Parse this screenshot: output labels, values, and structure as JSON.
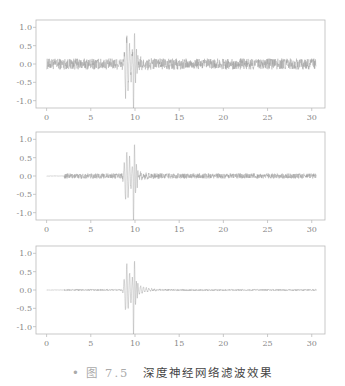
{
  "caption": {
    "bullet": "•",
    "figure_number": "图 7.5",
    "text": "深度神经网络滤波效果"
  },
  "colors": {
    "signal": "#9a9a9a",
    "axes": "#bbbbbb",
    "tick_text": "#888888"
  },
  "chart_data": [
    {
      "type": "line",
      "label": "a)",
      "title": "",
      "xlabel": "",
      "ylabel": "",
      "xlim": [
        -1.2,
        31.5
      ],
      "ylim": [
        -1.2,
        1.2
      ],
      "x_ticks": [
        0,
        5,
        10,
        15,
        20,
        25,
        30
      ],
      "y_ticks": [
        1.0,
        0.5,
        0.0,
        -0.5,
        -1.0
      ],
      "y_tick_labels": [
        "1.0",
        "0.5",
        "0.0",
        "-0.5",
        "-1.0"
      ],
      "grid": false,
      "description": "Raw noisy seismic trace: broadband noise amplitude ~±0.15 across 0–30.5 s; main event at ~8.5–10.5 s with peaks ~+0.95 and ~-1.0",
      "x_start": 0.0,
      "x_end": 30.5,
      "noise_amplitude": 0.15,
      "noise_start": 0.0,
      "event_center": 9.0,
      "event_peak_max": 0.95,
      "event_peak_min": -1.0
    },
    {
      "type": "line",
      "label": "b)",
      "title": "",
      "xlabel": "",
      "ylabel": "",
      "xlim": [
        -1.2,
        31.5
      ],
      "ylim": [
        -1.2,
        1.2
      ],
      "x_ticks": [
        0,
        5,
        10,
        15,
        20,
        25,
        30
      ],
      "y_ticks": [
        1.0,
        0.5,
        0.0,
        -0.5,
        -1.0
      ],
      "y_tick_labels": [
        "1.0",
        "0.5",
        "0.0",
        "-0.5",
        "-1.0"
      ],
      "grid": false,
      "description": "Partially filtered trace: flat 0–2 s, reduced noise ~±0.07 from 2 s onward; event at ~8.5–10.5 s with peaks ~+0.9 and ~-0.85",
      "x_start": 0.0,
      "x_end": 30.5,
      "noise_amplitude": 0.07,
      "noise_start": 2.0,
      "event_center": 9.0,
      "event_peak_max": 0.9,
      "event_peak_min": -0.85
    },
    {
      "type": "line",
      "label": "c)",
      "title": "",
      "xlabel": "",
      "ylabel": "",
      "xlim": [
        -1.2,
        31.5
      ],
      "ylim": [
        -1.2,
        1.2
      ],
      "x_ticks": [
        0,
        5,
        10,
        15,
        20,
        25,
        30
      ],
      "y_ticks": [
        1.0,
        0.5,
        0.0,
        -0.5,
        -1.0
      ],
      "y_tick_labels": [
        "1.0",
        "0.5",
        "0.0",
        "-0.5",
        "-1.0"
      ],
      "grid": false,
      "description": "Deep-neural-network filtered trace: near-zero baseline (~±0.02); event at ~8.5–10.5 s with peaks ~+0.8 and ~-0.7, decaying coda until ~15 s",
      "x_start": 0.0,
      "x_end": 30.5,
      "noise_amplitude": 0.02,
      "noise_start": 2.0,
      "event_center": 9.0,
      "event_peak_max": 0.8,
      "event_peak_min": -0.7
    }
  ]
}
